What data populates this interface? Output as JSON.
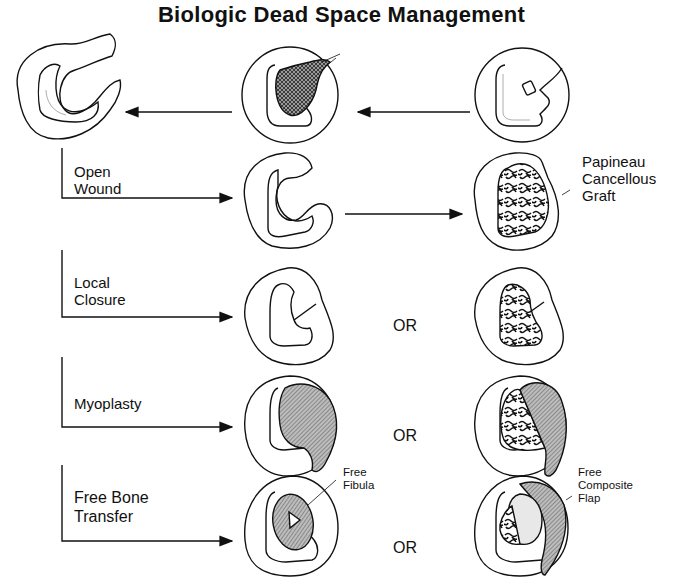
{
  "title": "Biologic Dead Space Management",
  "rows": [
    {
      "label_lines": [
        "Open",
        "Wound"
      ],
      "connector": "arrow",
      "right_annotation": [
        "Papineau",
        "Cancellous",
        "Graft"
      ]
    },
    {
      "label_lines": [
        "Local",
        "Closure"
      ],
      "connector": "OR"
    },
    {
      "label_lines": [
        "Myoplasty"
      ],
      "connector": "OR"
    },
    {
      "label_lines": [
        "Free Bone",
        "Transfer"
      ],
      "connector": "OR",
      "middle_annotation": [
        "Free",
        "Fibula"
      ],
      "right_annotation": [
        "Free",
        "Composite",
        "Flap"
      ]
    }
  ],
  "labels": {
    "open_1": "Open",
    "open_2": "Wound",
    "local_1": "Local",
    "local_2": "Closure",
    "myoplasty": "Myoplasty",
    "fbt_1": "Free Bone",
    "fbt_2": "Transfer",
    "papineau_1": "Papineau",
    "papineau_2": "Cancellous",
    "papineau_3": "Graft",
    "fibula_1": "Free",
    "fibula_2": "Fibula",
    "flap_1": "Free",
    "flap_2": "Composite",
    "flap_3": "Flap",
    "or": "OR"
  },
  "colors": {
    "ink": "#111111",
    "hatch": "#888888",
    "background": "#ffffff"
  }
}
